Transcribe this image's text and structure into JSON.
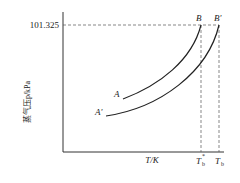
{
  "diagram": {
    "title": "",
    "y_axis_label": "蒸气压p/kPa",
    "x_axis_label": "T/K",
    "y_tick": "101.325",
    "curves": [
      {
        "name": "A",
        "start_label": "A",
        "end_label": "B"
      },
      {
        "name": "A'",
        "start_label": "A'",
        "end_label": "B'"
      }
    ],
    "x_ticks": [
      {
        "label": "T",
        "sub": "b",
        "sup": "*"
      },
      {
        "label": "T",
        "sub": "b",
        "sup": ""
      }
    ],
    "colors": {
      "line": "#222222",
      "dash": "#555555"
    }
  }
}
